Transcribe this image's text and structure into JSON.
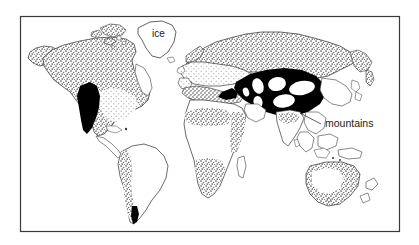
{
  "figure": {
    "kind": "world-map",
    "title_visible": false,
    "background_color": "#ffffff",
    "frame": {
      "name": "map-border",
      "color": "#3a3a3a",
      "x": 20,
      "y": 16,
      "width": 380,
      "height": 216
    }
  },
  "labels": {
    "ice": {
      "text": "ice",
      "color": "#1a1a1a",
      "x": 152,
      "y": 37,
      "target": "greenland-ice-sheet",
      "has_leader_line": false
    },
    "mountains": {
      "text": "mountains",
      "color": "#1a1a1a",
      "x": 325,
      "y": 127,
      "target": "central-asia-mountain-belt",
      "has_leader_line": true,
      "leader_from_x": 321,
      "leader_from_y": 124,
      "leader_to_x": 300,
      "leader_to_y": 113
    }
  },
  "legend_implicit": {
    "fills": [
      {
        "key": "black",
        "name": "mountains",
        "color": "#000000",
        "meaning": "mountains"
      },
      {
        "key": "coarse-stipple",
        "name": "coarse-stipple-region",
        "color": "#6b6b6b",
        "meaning": "tundra / steppe-tundra"
      },
      {
        "key": "fine-dots",
        "name": "fine-dot-region",
        "color": "#9a9a9a",
        "meaning": "dry steppe / desert"
      },
      {
        "key": "white",
        "name": "white-region",
        "color": "#ffffff",
        "meaning": "ice sheet / unclassified"
      }
    ]
  },
  "landmasses": [
    {
      "name": "alaska",
      "fill": "coarse-stipple"
    },
    {
      "name": "north-america",
      "fill": "coarse-stipple"
    },
    {
      "name": "north-america-interior",
      "fill": "fine-dots"
    },
    {
      "name": "rocky-mountains",
      "fill": "black"
    },
    {
      "name": "greenland",
      "fill": "white"
    },
    {
      "name": "canadian-arctic-islands",
      "fill": "coarse-stipple"
    },
    {
      "name": "central-america",
      "fill": "white"
    },
    {
      "name": "south-america",
      "fill": "white"
    },
    {
      "name": "andes",
      "fill": "coarse-stipple"
    },
    {
      "name": "patagonia-mountains",
      "fill": "black"
    },
    {
      "name": "europe",
      "fill": "fine-dots"
    },
    {
      "name": "northern-eurasia",
      "fill": "coarse-stipple"
    },
    {
      "name": "mediterranean-north-africa",
      "fill": "coarse-stipple"
    },
    {
      "name": "central-asia-mountain-belt",
      "fill": "black"
    },
    {
      "name": "africa",
      "fill": "white"
    },
    {
      "name": "sahel-east-africa",
      "fill": "coarse-stipple"
    },
    {
      "name": "southern-africa",
      "fill": "coarse-stipple"
    },
    {
      "name": "madagascar",
      "fill": "white"
    },
    {
      "name": "india",
      "fill": "coarse-stipple"
    },
    {
      "name": "southeast-asia",
      "fill": "white"
    },
    {
      "name": "indonesia-sunda",
      "fill": "white"
    },
    {
      "name": "new-guinea",
      "fill": "white"
    },
    {
      "name": "australia",
      "fill": "coarse-stipple"
    },
    {
      "name": "australia-interior",
      "fill": "white"
    },
    {
      "name": "tasmania",
      "fill": "white"
    },
    {
      "name": "new-zealand",
      "fill": "white"
    },
    {
      "name": "japan",
      "fill": "white"
    }
  ]
}
